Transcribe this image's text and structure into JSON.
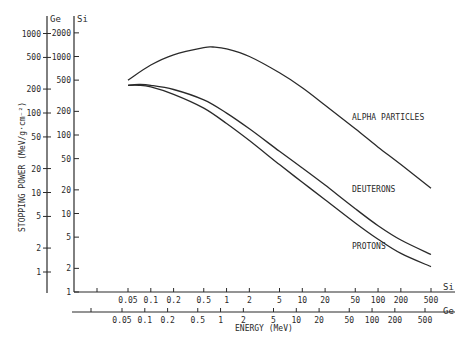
{
  "chart_data": {
    "type": "line",
    "title": "",
    "xlabel": "ENERGY (MeV)",
    "ylabel": "STOPPING POWER (MeV/g·cm⁻²)",
    "xscale": "log",
    "yscale": "log",
    "grid": false,
    "legend_position": "inline-labels",
    "y_axes": [
      {
        "name": "Ge",
        "ticks": [
          1,
          2,
          5,
          10,
          20,
          50,
          100,
          200,
          500,
          1000
        ]
      },
      {
        "name": "Si",
        "ticks": [
          1,
          2,
          5,
          10,
          20,
          50,
          100,
          200,
          500,
          1000,
          2000
        ]
      }
    ],
    "x_axes": [
      {
        "name": "Si",
        "ticks": [
          0.05,
          0.1,
          0.2,
          0.5,
          1,
          2,
          5,
          10,
          20,
          50,
          100,
          200,
          500
        ]
      },
      {
        "name": "Ge",
        "ticks": [
          0.05,
          0.1,
          0.2,
          0.5,
          1,
          2,
          5,
          10,
          20,
          50,
          100,
          200,
          500
        ]
      }
    ],
    "xlim": [
      0.02,
      800
    ],
    "ylim_si": [
      1,
      2500
    ],
    "series": [
      {
        "name": "ALPHA PARTICLES",
        "x": [
          0.05,
          0.1,
          0.2,
          0.5,
          0.66,
          1,
          2,
          5,
          10,
          20,
          50,
          100,
          200,
          500
        ],
        "y": [
          500,
          780,
          1050,
          1300,
          1320,
          1250,
          1000,
          620,
          400,
          240,
          120,
          70,
          42,
          21
        ]
      },
      {
        "name": "DEUTERONS",
        "x": [
          0.05,
          0.07,
          0.1,
          0.2,
          0.5,
          1,
          2,
          5,
          10,
          20,
          50,
          100,
          200,
          500
        ],
        "y": [
          430,
          440,
          430,
          380,
          280,
          190,
          120,
          62,
          38,
          23,
          11.5,
          7,
          4.6,
          3.0
        ]
      },
      {
        "name": "PROTONS",
        "x": [
          0.05,
          0.07,
          0.1,
          0.2,
          0.5,
          1,
          2,
          5,
          10,
          20,
          50,
          100,
          200,
          500
        ],
        "y": [
          430,
          430,
          410,
          330,
          220,
          140,
          85,
          42,
          25,
          15,
          7.6,
          4.7,
          3.1,
          2.1
        ]
      }
    ],
    "annotations": [
      "ALPHA PARTICLES",
      "DEUTERONS",
      "PROTONS"
    ]
  },
  "labels": {
    "y_axis_ge": "Ge",
    "y_axis_si": "Si",
    "x_axis_si": "Si",
    "x_axis_ge": "Ge",
    "xlabel": "ENERGY (MeV)",
    "ylabel": "STOPPING POWER (MeV/g·cm⁻²)",
    "alpha": "ALPHA PARTICLES",
    "deuterons": "DEUTERONS",
    "protons": "PROTONS"
  }
}
